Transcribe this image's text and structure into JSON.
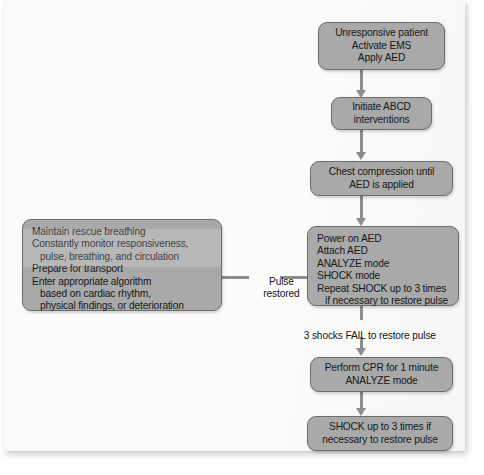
{
  "diagram": {
    "colors": {
      "node_fill": "#a9a9a9",
      "node_border": "#6d6d6d",
      "connector": "#8d8d8d",
      "text": "#16181a",
      "page": "#fbfbfa",
      "background": "#ffffff"
    },
    "nodes": [
      {
        "id": "unresponsive",
        "lines": [
          "Unresponsive patient",
          "Activate EMS",
          "Apply AED"
        ]
      },
      {
        "id": "abcd",
        "lines": [
          "Initiate ABCD",
          "interventions"
        ]
      },
      {
        "id": "chest-compression",
        "lines": [
          "Chest compression until",
          "AED is applied"
        ]
      },
      {
        "id": "power-on-aed",
        "lines": [
          "Power on AED",
          "Attach AED",
          "ANALYZE mode",
          "SHOCK mode",
          "Repeat SHOCK up to 3 times",
          "   if necessary to restore pulse"
        ]
      },
      {
        "id": "maintain-rescue",
        "lines": [
          "Maintain rescue breathing",
          "Constantly monitor responsiveness,",
          "   pulse, breathing, and circulation",
          "Prepare for transport",
          "Enter appropriate algorithm",
          "   based on cardiac rhythm,",
          "   physical findings, or deterioration"
        ]
      },
      {
        "id": "perform-cpr",
        "lines": [
          "Perform CPR for 1 minute",
          "ANALYZE mode"
        ]
      },
      {
        "id": "shock-3-times",
        "lines": [
          "SHOCK up to 3 times if",
          "necessary to restore pulse"
        ]
      }
    ],
    "edge_labels": [
      {
        "id": "pulse-restored",
        "lines": [
          "Pulse",
          "restored"
        ]
      },
      {
        "id": "shocks-fail",
        "lines": [
          "3 shocks FAIL to restore pulse"
        ]
      }
    ]
  }
}
